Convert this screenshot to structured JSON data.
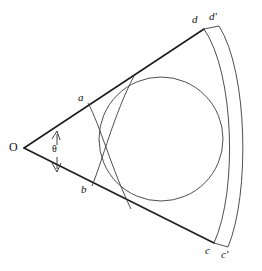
{
  "figure": {
    "type": "geometry-diagram",
    "background_color": "#ffffff",
    "line_color": "#1a1a1a",
    "curve_color": "#3a3a3a"
  },
  "labels": {
    "vertex_O": "O",
    "point_a": "a",
    "point_b": "b",
    "point_c": "c",
    "point_c_prime": "c'",
    "point_d": "d",
    "point_d_prime": "d'",
    "angle_theta": "θ"
  },
  "geometry": {
    "vertex": {
      "x": 24,
      "y": 148
    },
    "upper_ray_end": {
      "x": 204,
      "y": 29
    },
    "lower_ray_end": {
      "x": 214,
      "y": 243
    },
    "inscribed_circle": {
      "cx": 161,
      "cy": 139,
      "r": 62
    },
    "arc_inner": {
      "from": "d",
      "to": "c",
      "start": {
        "x": 204,
        "y": 29
      },
      "end": {
        "x": 214,
        "y": 243
      },
      "bulge_x": 238
    },
    "arc_outer": {
      "from": "d'",
      "to": "c'",
      "start": {
        "x": 219,
        "y": 26
      },
      "end": {
        "x": 228,
        "y": 247
      },
      "bulge_x": 248
    },
    "small_arc_a": {
      "start": {
        "x": 88,
        "y": 103
      },
      "end": {
        "x": 130,
        "y": 207
      }
    },
    "small_arc_b": {
      "start": {
        "x": 92,
        "y": 186
      },
      "end": {
        "x": 133,
        "y": 76
      }
    },
    "theta_arrow": {
      "x": 57,
      "y_top": 131,
      "y_bottom": 172
    }
  }
}
